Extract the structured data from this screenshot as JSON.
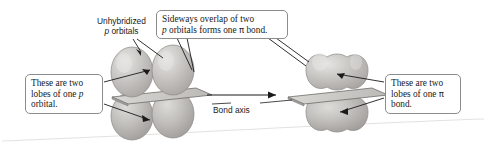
{
  "figure": {
    "background_color": "#ffffff"
  },
  "callouts": {
    "top": {
      "line1_a": "Sideways overlap of two",
      "line2_a": "p",
      "line2_b": " orbitals forms one ",
      "line2_pi": "π",
      "line2_c": " bond."
    },
    "left": {
      "line1": "These are two",
      "line2_a": "lobes of one ",
      "line2_p": "p",
      "line3": "orbital."
    },
    "right": {
      "line1": "These are two",
      "line2_a": "lobes of one ",
      "line2_pi": "π",
      "line3": "bond."
    }
  },
  "labels": {
    "unhybridized_line1": "Unhybridized",
    "unhybridized_p": "p",
    "unhybridized_line2_rest": " orbitals",
    "bond_axis": "Bond axis"
  },
  "colors": {
    "lobe_fill": "#b9b6b3",
    "lobe_fill_light": "#cfcdca",
    "lobe_highlight": "#e2e1de",
    "lobe_stroke": "#7d7a77",
    "plane_fill": "#c6c4c1",
    "plane_top_fill": "#d6d4d1",
    "plane_stroke": "#6f6c69",
    "leader_line": "#1a1a1a",
    "callout_border": "#8c8c8c",
    "text": "#1a1a1a",
    "baseline": "#dcdcda"
  },
  "structures": {
    "left": {
      "name": "two-unhybridized-p-orbitals",
      "lobe_count": 4,
      "description": "Two separate p orbitals, each with two lobes above and below the plane"
    },
    "right": {
      "name": "pi-bond-overlapped-orbitals",
      "lobe_count": 4,
      "description": "Sideways overlapped p orbitals forming one pi bond with fused upper and lower lobes"
    }
  },
  "arrow": {
    "name": "bond-axis-arrow",
    "direction": "right"
  }
}
